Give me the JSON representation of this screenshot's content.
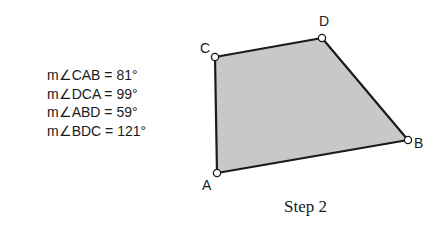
{
  "angles": [
    {
      "text": "m∠CAB = 81°"
    },
    {
      "text": "m∠DCA = 99°"
    },
    {
      "text": "m∠ABD = 59°"
    },
    {
      "text": "m∠BDC = 121°"
    }
  ],
  "quadrilateral": {
    "fill": "#c8c8c8",
    "stroke": "#1a1a1a",
    "vertices": {
      "A": {
        "label": "A"
      },
      "B": {
        "label": "B"
      },
      "C": {
        "label": "C"
      },
      "D": {
        "label": "D"
      }
    }
  },
  "caption": "Step 2"
}
